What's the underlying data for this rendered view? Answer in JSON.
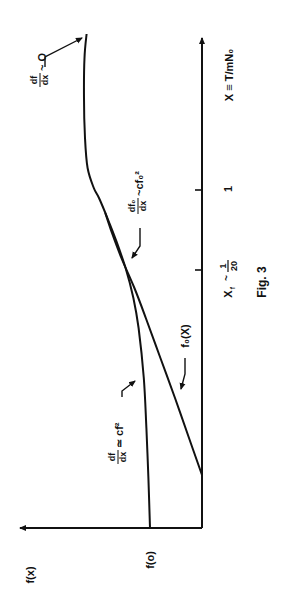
{
  "chart_data": {
    "type": "line",
    "title": "",
    "caption": "Fig. 3",
    "orientation": "rotated-90-ccw",
    "xlabel": "X ≡ T/mN₀",
    "ylabel": "f(x)",
    "x_range": [
      0,
      4.9
    ],
    "y_range": [
      0,
      3.5
    ],
    "grid": false,
    "x_ticks": [
      {
        "value": 2.58,
        "label": "x_f ~ 1/20",
        "parts": {
          "main": "X",
          "sub": "f",
          "approx": "~",
          "num": "1",
          "den": "20"
        }
      },
      {
        "value": 3.38,
        "label": "1"
      }
    ],
    "y_ticks": [
      {
        "value": 1.0,
        "label": "f(o)"
      }
    ],
    "series": [
      {
        "name": "f(x)",
        "x": [
          0,
          0.5,
          1.0,
          1.5,
          2.0,
          2.3,
          2.6,
          2.9,
          3.1,
          3.3,
          3.4,
          3.6,
          3.9,
          4.3,
          4.7,
          4.94
        ],
        "y": [
          1.0,
          1.03,
          1.07,
          1.12,
          1.22,
          1.32,
          1.47,
          1.67,
          1.82,
          1.98,
          2.08,
          2.2,
          2.25,
          2.27,
          2.26,
          2.22
        ]
      },
      {
        "name": "f₀(x)",
        "x": [
          0.53,
          0.9,
          1.3,
          1.7,
          2.1,
          2.4,
          2.7,
          2.95,
          3.15
        ],
        "y": [
          0.0,
          0.25,
          0.52,
          0.8,
          1.08,
          1.3,
          1.55,
          1.73,
          1.86
        ]
      }
    ],
    "annotations": [
      {
        "text": "df/dx ~ O",
        "parts": {
          "num": "df",
          "den": "dx",
          "rel": "~ O"
        },
        "target_series": "f(x)",
        "at_x": 4.94
      },
      {
        "text": "df₀/dx ~ cf₀²",
        "parts": {
          "num": "df₀",
          "den": "dx",
          "rel": "~cf₀²"
        },
        "target_series": "f₀(x)",
        "at_x": 2.95
      },
      {
        "text": "df/dx ≃ cf²",
        "parts": {
          "num": "df",
          "den": "dx",
          "rel": "≃ cf²"
        },
        "target_series": "f(x)",
        "at_x": 2.2
      },
      {
        "text": "f₀(X)",
        "target_series": "f₀(x)",
        "at_x": 1.3
      }
    ]
  }
}
